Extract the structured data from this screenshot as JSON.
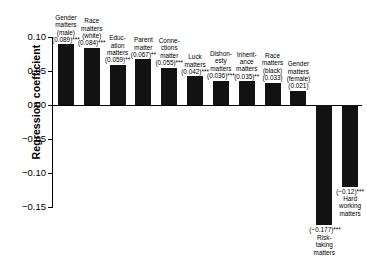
{
  "chart_data": {
    "type": "bar",
    "title": "",
    "xlabel": "",
    "ylabel": "Regression coefficient",
    "ylim": [
      -0.165,
      0.115
    ],
    "yticks": [
      0.1,
      0.05,
      0.0,
      -0.05,
      -0.1,
      -0.15
    ],
    "ytick_labels": [
      "0.10",
      "0.05",
      "0.00",
      "−0.05",
      "−0.10",
      "−0.15"
    ],
    "grid": false,
    "legend": "none",
    "categories": [
      "Gender matters (male)",
      "Race matters (white)",
      "Education matters",
      "Parent matter",
      "Connections matter",
      "Luck matters",
      "Dishonesty matters",
      "Inheritance matters",
      "Race matters (black)",
      "Gender matters (female)",
      "Risk-taking matters",
      "Hard working matters"
    ],
    "values": [
      0.089,
      0.084,
      0.059,
      0.067,
      0.055,
      0.042,
      0.036,
      0.035,
      0.033,
      0.021,
      -0.177,
      -0.12
    ],
    "value_labels": [
      "(0.089)***",
      "(0.084)***",
      "(0.059)**",
      "(0.067)**",
      "(0.055)***",
      "(0.042)***",
      "(0.036)***",
      "(0.035)**",
      "(0.033)",
      "(0.021)",
      "(−0.177)***",
      "(−0.12)***"
    ],
    "significance": [
      "***",
      "***",
      "**",
      "**",
      "***",
      "***",
      "***",
      "**",
      "",
      "",
      "***",
      "***"
    ],
    "bars": [
      {
        "name": "gender-matters-male",
        "value": 0.089,
        "value_label": "(0.089)***",
        "label_lines": [
          "Gender",
          "matters",
          "(male)"
        ]
      },
      {
        "name": "race-matters-white",
        "value": 0.084,
        "value_label": "(0.084)***",
        "label_lines": [
          "Race",
          "matters",
          "(white)"
        ]
      },
      {
        "name": "education-matters",
        "value": 0.059,
        "value_label": "(0.059)**",
        "label_lines": [
          "Educ-",
          "ation",
          "matters"
        ]
      },
      {
        "name": "parent-matter",
        "value": 0.067,
        "value_label": "(0.067)**",
        "label_lines": [
          "Parent",
          "matter"
        ]
      },
      {
        "name": "connections-matter",
        "value": 0.055,
        "value_label": "(0.055)***",
        "label_lines": [
          "Conne-",
          "ctions",
          "matter"
        ]
      },
      {
        "name": "luck-matters",
        "value": 0.042,
        "value_label": "(0.042)***",
        "label_lines": [
          "Luck",
          "matters"
        ]
      },
      {
        "name": "dishonesty-matters",
        "value": 0.036,
        "value_label": "(0.036)***",
        "label_lines": [
          "Dishon-",
          "esty",
          "matters"
        ]
      },
      {
        "name": "inheritance-matters",
        "value": 0.035,
        "value_label": "(0.035)**",
        "label_lines": [
          "Inherit-",
          "ance",
          "matters"
        ]
      },
      {
        "name": "race-matters-black",
        "value": 0.033,
        "value_label": "(0.033)",
        "label_lines": [
          "Race",
          "matters",
          "(black)"
        ]
      },
      {
        "name": "gender-matters-female",
        "value": 0.021,
        "value_label": "(0.021)",
        "label_lines": [
          "Gender",
          "matters",
          "(female)"
        ]
      },
      {
        "name": "risk-taking-matters",
        "value": -0.177,
        "value_label": "(−0.177)***",
        "label_lines": [
          "Risk-",
          "taking",
          "matters"
        ]
      },
      {
        "name": "hard-working-matters",
        "value": -0.12,
        "value_label": "(−0.12)***",
        "label_lines": [
          "Hard",
          "working",
          "matters"
        ]
      }
    ],
    "bar_color": "#121212"
  }
}
